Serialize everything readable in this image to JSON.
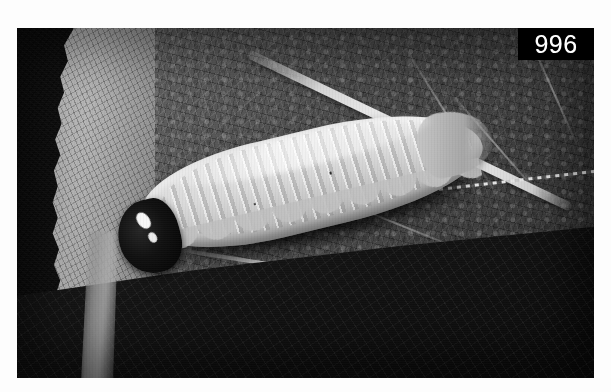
{
  "page": {
    "background_color": "#fdfdfd",
    "width": 611,
    "height": 392
  },
  "photo": {
    "label": "grayscale-macro-photograph",
    "subject": "pale caterpillar larva resting on a serrated leaf",
    "border_color": "#fdfdfd",
    "frame": {
      "x": 17,
      "y": 28,
      "width": 577,
      "height": 350
    }
  },
  "plate": {
    "number": "996",
    "background_color": "#030303",
    "text_color": "#ffffff"
  },
  "scene": {
    "backdrop_color": "#121211",
    "leaf_main_color": "#5c5c58",
    "leaf_serration_color": "#c9c9c4",
    "leaf_lower_color": "#161615",
    "midrib_color": "#eeeee9",
    "larva_body_color": "#d6d6d0",
    "larva_head_color": "#0d0d0c",
    "larva_eye_color": "#f2f2ee"
  }
}
